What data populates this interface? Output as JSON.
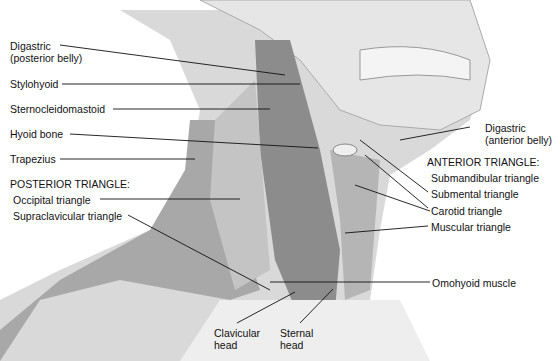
{
  "diagram": {
    "labels": {
      "digastric_posterior": [
        "Digastric",
        "(posterior belly)"
      ],
      "stylohyoid": "Stylohyoid",
      "sternocleidomastoid": "Sternocleidomastoid",
      "hyoid_bone": "Hyoid bone",
      "trapezius": "Trapezius",
      "posterior_triangle": "POSTERIOR TRIANGLE:",
      "occipital_triangle": "Occipital triangle",
      "supraclavicular_triangle": "Supraclavicular triangle",
      "digastric_anterior": [
        "Digastric",
        "(anterior belly)"
      ],
      "anterior_triangle": "ANTERIOR TRIANGLE:",
      "submandibular_triangle": "Submandibular triangle",
      "submental_triangle": "Submental triangle",
      "carotid_triangle": "Carotid triangle",
      "muscular_triangle": "Muscular triangle",
      "omohyoid_muscle": "Omohyoid muscle",
      "clavicular_head": [
        "Clavicular",
        "head"
      ],
      "sternal_head": [
        "Sternal",
        "head"
      ]
    },
    "colors": {
      "muscle": "#9a9a9a",
      "muscle_dark": "#6e6e6e",
      "skin": "#dcdcdc",
      "bone": "#e8e8e8",
      "line": "#111111"
    }
  }
}
